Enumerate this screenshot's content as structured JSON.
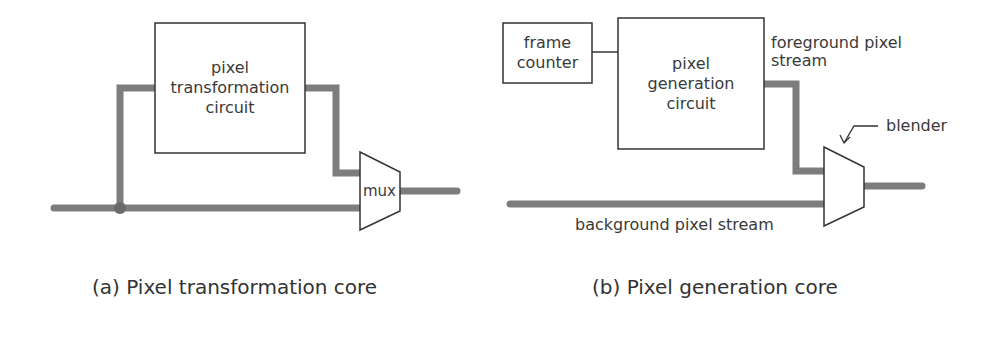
{
  "figure_a": {
    "box_label": [
      "pixel",
      "transformation",
      "circuit"
    ],
    "mux_label": "mux",
    "caption": "(a)  Pixel transformation core"
  },
  "figure_b": {
    "frame_counter_label": [
      "frame",
      "counter"
    ],
    "box_label": [
      "pixel",
      "generation",
      "circuit"
    ],
    "foreground_label": [
      "foreground pixel",
      "stream"
    ],
    "blender_label": "blender",
    "background_label": "background pixel stream",
    "caption": "(b)  Pixel generation core"
  },
  "colors": {
    "wire": "#7a7a7a",
    "outline": "#333333",
    "text": "#3a3a3a"
  }
}
